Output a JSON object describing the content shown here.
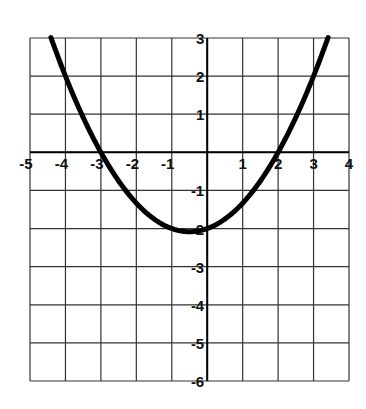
{
  "chart_data": {
    "type": "line",
    "title": "",
    "xlabel": "",
    "ylabel": "",
    "xlim": [
      -5,
      4
    ],
    "ylim": [
      -6,
      3
    ],
    "grid": true,
    "x_ticks": [
      "-5",
      "-4",
      "-3",
      "-2",
      "-1",
      "1",
      "2",
      "3",
      "4"
    ],
    "y_ticks": [
      "3",
      "2",
      "1",
      "-1",
      "-2",
      "-3",
      "-4",
      "-5",
      "-6"
    ],
    "series": [
      {
        "name": "parabola",
        "equation": "y = (x + 3)(x - 2) / 3",
        "x": [
          -4.41,
          -4,
          -3.5,
          -3,
          -2.5,
          -2,
          -1.5,
          -1,
          -0.5,
          0,
          0.5,
          1,
          1.5,
          2,
          2.5,
          3,
          3.41
        ],
        "y": [
          3.0,
          2.0,
          0.92,
          0.0,
          -0.75,
          -1.33,
          -1.75,
          -2.0,
          -2.08,
          -2.0,
          -1.75,
          -1.33,
          -0.75,
          0.0,
          0.92,
          2.0,
          3.0
        ]
      }
    ],
    "roots": [
      -3,
      2
    ],
    "vertex": [
      -0.5,
      -2.08
    ],
    "colors": {
      "curve": "#000000",
      "grid": "#333333",
      "background": "#ffffff"
    }
  }
}
